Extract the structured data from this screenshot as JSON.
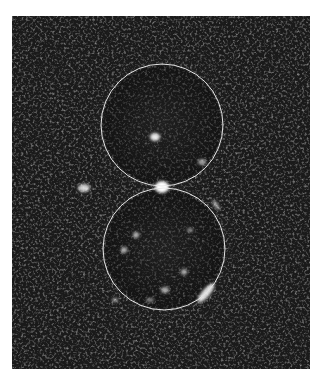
{
  "image": {
    "type": "grayscale micrograph",
    "background": "#ffffff",
    "panel": {
      "x": 12,
      "y": 16,
      "width": 298,
      "height": 353,
      "fill": "#1a1a1a"
    },
    "overlay_color": "#e6e6e6",
    "circles": [
      {
        "name": "upper-circle",
        "cx": 162,
        "cy": 125,
        "r": 61
      },
      {
        "name": "lower-circle",
        "cx": 164,
        "cy": 249,
        "r": 61
      }
    ],
    "bright_spots": [
      {
        "name": "junction-spot",
        "cx": 162,
        "cy": 187,
        "rx": 7,
        "ry": 6,
        "opacity": 1.0
      },
      {
        "name": "upper-inner-spot",
        "cx": 155,
        "cy": 137,
        "rx": 5,
        "ry": 4,
        "opacity": 0.9
      },
      {
        "name": "left-spot",
        "cx": 84,
        "cy": 188,
        "rx": 6,
        "ry": 4,
        "opacity": 0.8
      },
      {
        "name": "lower-right-arc",
        "cx": 206,
        "cy": 293,
        "rx": 12,
        "ry": 4,
        "rotate": -50,
        "opacity": 0.85
      },
      {
        "name": "right-streak",
        "cx": 216,
        "cy": 205,
        "rx": 6,
        "ry": 2,
        "rotate": 55,
        "opacity": 0.6
      },
      {
        "name": "upper-right-spot",
        "cx": 202,
        "cy": 162,
        "rx": 4,
        "ry": 3,
        "opacity": 0.6
      },
      {
        "name": "lower-spot-1",
        "cx": 136,
        "cy": 235,
        "rx": 3,
        "ry": 3,
        "opacity": 0.7
      },
      {
        "name": "lower-spot-2",
        "cx": 124,
        "cy": 250,
        "rx": 3,
        "ry": 3,
        "opacity": 0.7
      },
      {
        "name": "lower-spot-3",
        "cx": 184,
        "cy": 272,
        "rx": 3,
        "ry": 3,
        "opacity": 0.65
      },
      {
        "name": "lower-spot-4",
        "cx": 165,
        "cy": 290,
        "rx": 4,
        "ry": 3,
        "opacity": 0.65
      },
      {
        "name": "lower-spot-5",
        "cx": 150,
        "cy": 300,
        "rx": 4,
        "ry": 2,
        "opacity": 0.5
      },
      {
        "name": "lower-spot-6",
        "cx": 190,
        "cy": 230,
        "rx": 3,
        "ry": 2,
        "opacity": 0.55
      },
      {
        "name": "left-edge-spot",
        "cx": 115,
        "cy": 300,
        "rx": 3,
        "ry": 2,
        "opacity": 0.6
      }
    ]
  }
}
